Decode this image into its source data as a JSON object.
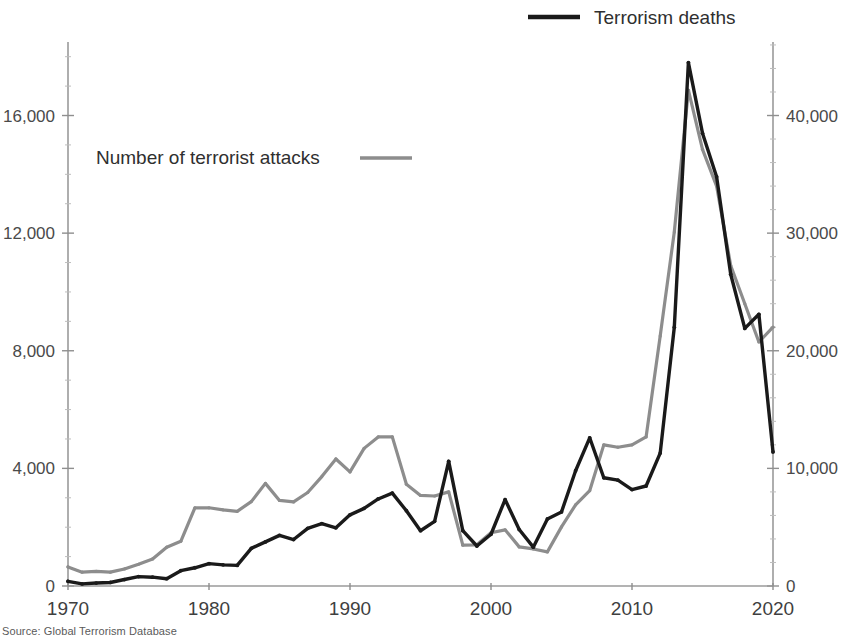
{
  "figure": {
    "source_note": "Source: Global Terrorism Database",
    "title_fragment": "Terrorism deaths and attacks, 1970–2020"
  },
  "legend": {
    "deaths_label": "Terrorism deaths",
    "attacks_label": "Number of terrorist attacks"
  },
  "axes": {
    "left_ticks": [
      "0",
      "4,000",
      "8,000",
      "12,000",
      "16,000"
    ],
    "right_ticks": [
      "0",
      "10,000",
      "20,000",
      "30,000",
      "40,000"
    ],
    "x_ticks": [
      "1970",
      "1980",
      "1990",
      "2000",
      "2010",
      "2020"
    ]
  },
  "colors": {
    "deaths_line": "#1a1a1a",
    "attacks_line": "#8d8d8d",
    "axis": "#9a9a9a",
    "text": "#3f3f3f"
  },
  "chart_data": {
    "type": "line",
    "title": "Terrorism deaths and attacks, 1970–2020",
    "subtitle": "",
    "xlabel": "",
    "ylabel": "Number of terrorist attacks",
    "ylabel_right": "Terrorism deaths",
    "grid": false,
    "legend_position": "top",
    "xlim": [
      1970,
      2020
    ],
    "ylim": [
      0,
      18500
    ],
    "ylim_right": [
      0,
      46250
    ],
    "x": [
      1970,
      1971,
      1972,
      1973,
      1974,
      1975,
      1976,
      1977,
      1978,
      1979,
      1980,
      1981,
      1982,
      1983,
      1984,
      1985,
      1986,
      1987,
      1988,
      1989,
      1990,
      1991,
      1992,
      1993,
      1994,
      1995,
      1996,
      1997,
      1998,
      1999,
      2000,
      2001,
      2002,
      2003,
      2004,
      2005,
      2006,
      2007,
      2008,
      2009,
      2010,
      2011,
      2012,
      2013,
      2014,
      2015,
      2016,
      2017,
      2018,
      2019,
      2020
    ],
    "series": [
      {
        "name": "Number of terrorist attacks",
        "axis": "left",
        "color": "#8d8d8d",
        "values": [
          650,
          470,
          500,
          470,
          580,
          740,
          920,
          1320,
          1520,
          2660,
          2660,
          2590,
          2540,
          2870,
          3490,
          2910,
          2860,
          3180,
          3720,
          4320,
          3880,
          4680,
          5070,
          5070,
          3460,
          3080,
          3060,
          3200,
          1390,
          1400,
          1810,
          1910,
          1330,
          1260,
          1160,
          2010,
          2760,
          3240,
          4800,
          4720,
          4800,
          5070,
          8500,
          12040,
          16860,
          14850,
          13600,
          10900,
          9600,
          8300,
          8800
        ]
      },
      {
        "name": "Terrorism deaths",
        "axis": "right",
        "color": "#1a1a1a",
        "values": [
          400,
          180,
          250,
          300,
          550,
          800,
          750,
          620,
          1300,
          1550,
          1900,
          1800,
          1750,
          3200,
          3750,
          4300,
          3950,
          4900,
          5300,
          4950,
          6050,
          6600,
          7400,
          7900,
          6400,
          4700,
          5500,
          10600,
          4700,
          3400,
          4400,
          7350,
          4800,
          3300,
          5700,
          6300,
          9800,
          12600,
          9200,
          9000,
          8200,
          8500,
          11300,
          22000,
          44500,
          38500,
          34800,
          26500,
          21900,
          23100,
          11400
        ]
      }
    ]
  }
}
